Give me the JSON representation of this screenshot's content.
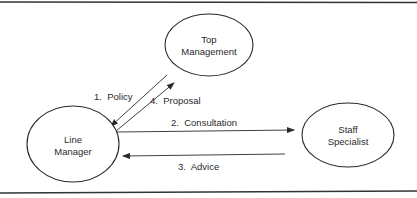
{
  "diagram": {
    "type": "flow",
    "nodes": [
      {
        "id": "top",
        "line1": "Top",
        "line2": "Management",
        "cx": 209,
        "cy": 45,
        "rx": 44,
        "ry": 31
      },
      {
        "id": "line",
        "line1": "Line",
        "line2": "Manager",
        "cx": 73,
        "cy": 144,
        "rx": 46,
        "ry": 38
      },
      {
        "id": "staff",
        "line1": "Staff",
        "line2": "Specialist",
        "cx": 348,
        "cy": 135,
        "rx": 46,
        "ry": 32
      }
    ],
    "edges": [
      {
        "id": "policy",
        "label": "1.  Policy",
        "from": "Top Management",
        "to": "Line Manager"
      },
      {
        "id": "consultation",
        "label": "2.  Consultation",
        "from": "Line Manager",
        "to": "Staff Specialist"
      },
      {
        "id": "advice",
        "label": "3.  Advice",
        "from": "Staff Specialist",
        "to": "Line Manager"
      },
      {
        "id": "proposal",
        "label": "4.  Proposal",
        "from": "Line Manager",
        "to": "Top Management"
      }
    ],
    "colors": {
      "stroke": "#2a2a2a",
      "background": "#ffffff"
    }
  }
}
